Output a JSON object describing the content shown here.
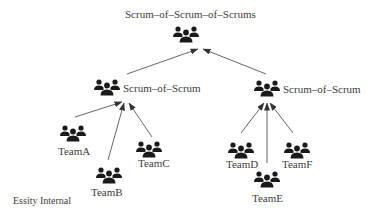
{
  "diagram": {
    "type": "hierarchy",
    "root": {
      "label": "Scrum–of–Scrum–of–Scrums",
      "icon": "group-icon"
    },
    "mid": [
      {
        "label": "Scrum–of–Scrum",
        "icon": "group-icon"
      },
      {
        "label": "Scrum–of–Scrum",
        "icon": "group-icon"
      }
    ],
    "teams": [
      {
        "label": "TeamA",
        "parent": 0,
        "icon": "group-icon"
      },
      {
        "label": "TeamB",
        "parent": 0,
        "icon": "group-icon"
      },
      {
        "label": "TeamC",
        "parent": 0,
        "icon": "group-icon"
      },
      {
        "label": "TeamD",
        "parent": 1,
        "icon": "group-icon"
      },
      {
        "label": "TeamE",
        "parent": 1,
        "icon": "group-icon"
      },
      {
        "label": "TeamF",
        "parent": 1,
        "icon": "group-icon"
      }
    ],
    "footer": "Essity Internal",
    "colors": {
      "icon": "#1a1a1a",
      "arrow": "#555555",
      "text": "#3c3c3c"
    }
  }
}
